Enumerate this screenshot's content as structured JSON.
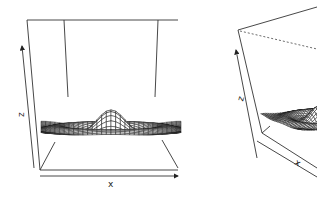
{
  "chart_data": [
    {
      "type": "surface",
      "title": "",
      "function": "z = sin(r)/r, r = sqrt(x^2 + y^2)",
      "xlabel": "x",
      "ylabel": "y",
      "zlabel": "z",
      "xlim": [
        -10,
        10
      ],
      "ylim": [
        -10,
        10
      ],
      "zlim": [
        -0.22,
        1.0
      ],
      "view": {
        "theta": 0,
        "phi": 20
      },
      "grid_lines": 30,
      "peak": {
        "x": 0,
        "y": 0,
        "z": 1.0
      }
    },
    {
      "type": "surface",
      "title": "",
      "function": "z = sin(r)/r, r = sqrt(x^2 + y^2)",
      "xlabel": "x",
      "ylabel": "y",
      "zlabel": "z",
      "xlim": [
        -10,
        10
      ],
      "ylim": [
        -10,
        10
      ],
      "zlim": [
        -0.22,
        1.0
      ],
      "view": {
        "theta": 30,
        "phi": 30
      },
      "grid_lines": 30,
      "cropped": true
    }
  ],
  "labels": {
    "left_x": "x",
    "left_z": "z",
    "right_x": "x",
    "right_z": "z"
  },
  "colors": {
    "line": "#1a1a1a",
    "background": "#ffffff"
  }
}
